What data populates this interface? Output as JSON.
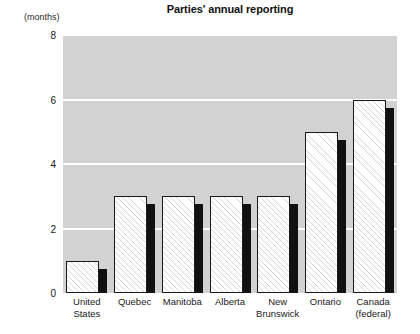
{
  "chart_data": {
    "type": "bar",
    "title": "Parties' annual reporting",
    "subtitle": "",
    "units_label": "(months)",
    "xlabel": "",
    "ylabel": "",
    "ylim": [
      0,
      8
    ],
    "yticks": [
      0,
      2,
      4,
      6,
      8
    ],
    "ytick_labels": [
      "0",
      "2",
      "4",
      "6",
      "8"
    ],
    "grid": true,
    "grid_orientation": "horizontal",
    "legend": false,
    "legend_position": "none",
    "bar_style": "hatched-with-shadow",
    "categories": [
      "United States",
      "Quebec",
      "Manitoba",
      "Alberta",
      "New Brunswick",
      "Ontario",
      "Canada (federal)"
    ],
    "category_lines": [
      [
        "United",
        "States"
      ],
      [
        "Quebec"
      ],
      [
        "Manitoba"
      ],
      [
        "Alberta"
      ],
      [
        "New",
        "Brunswick"
      ],
      [
        "Ontario"
      ],
      [
        "Canada",
        "(federal)"
      ]
    ],
    "values": [
      1,
      3,
      3,
      3,
      3,
      5,
      6
    ],
    "series": [
      {
        "name": "Annual reporting deadline",
        "values": [
          1,
          3,
          3,
          3,
          3,
          5,
          6
        ]
      }
    ]
  },
  "colors": {
    "plot_background": "#d2d2d2",
    "gridline": "#ffffff",
    "bar_face": "#ffffff",
    "bar_hatch": "#787878",
    "bar_border": "#1a1a1a",
    "bar_shadow": "#111111",
    "text": "#1a1a1a",
    "page_background": "#ffffff"
  }
}
